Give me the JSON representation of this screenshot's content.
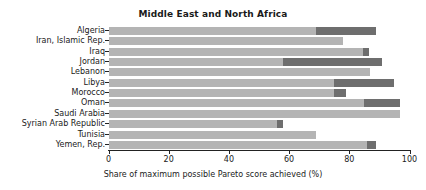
{
  "chart_data": {
    "type": "bar",
    "orientation": "horizontal",
    "stacked": true,
    "title": "Middle East and North Africa",
    "xlabel": "Share of maximum possible Pareto score achieved (%)",
    "ylabel": "",
    "xlim": [
      0,
      100
    ],
    "xticks": [
      0,
      20,
      40,
      60,
      80,
      100
    ],
    "xtick_labels": [
      "0",
      "20",
      "40",
      "60",
      "80",
      "100"
    ],
    "grid": false,
    "legend": "none",
    "categories": [
      "Algeria",
      "Iran, Islamic Rep.",
      "Iraq",
      "Jordan",
      "Lebanon",
      "Libya",
      "Morocco",
      "Oman",
      "Saudi Arabia",
      "Syrian Arab Republic",
      "Tunisia",
      "Yemen, Rep."
    ],
    "series": [
      {
        "name": "base",
        "color": "#b4b4b4",
        "values": [
          69,
          78,
          84.5,
          58,
          87,
          75,
          75,
          85,
          97,
          56,
          69,
          86
        ]
      },
      {
        "name": "increment",
        "color": "#6e6e6e",
        "values": [
          20,
          0,
          2,
          33,
          0,
          20,
          4,
          12,
          0,
          2,
          0,
          3
        ]
      }
    ],
    "totals": [
      89,
      78,
      86.5,
      91,
      87,
      95,
      79,
      97,
      97,
      58,
      69,
      89
    ]
  },
  "colors": {
    "bar_light": "#b4b4b4",
    "bar_dark": "#6e6e6e",
    "axis": "#222222",
    "text": "#1a1a1a",
    "background": "#ffffff"
  }
}
